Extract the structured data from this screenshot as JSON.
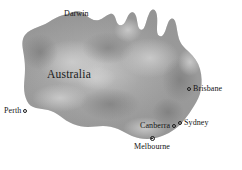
{
  "map": {
    "canvas": {
      "width": 242,
      "height": 170
    },
    "background_color": "#ffffff",
    "land_color": "#9a9a9a",
    "land_shadow_color": "#7d7d7d",
    "land_highlight_color": "#c2c2c2",
    "label_color": "#141414",
    "continent_label": "Australia",
    "region_name": "Australia",
    "cities": [
      {
        "name": "Darwin",
        "label": "Darwin",
        "marker": "none",
        "label_x": 64,
        "label_y": 9
      },
      {
        "name": "Perth",
        "label": "Perth",
        "marker": "open-circle",
        "marker_side": "right",
        "label_x": 4,
        "label_y": 106
      },
      {
        "name": "Brisbane",
        "label": "Brisbane",
        "marker": "open-circle",
        "marker_side": "left",
        "label_x": 192,
        "label_y": 84
      },
      {
        "name": "Sydney",
        "label": "Sydney",
        "marker": "open-circle",
        "marker_side": "left",
        "label_x": 185,
        "label_y": 118
      },
      {
        "name": "Canberra",
        "label": "Canberra",
        "marker": "open-circle",
        "marker_side": "right",
        "label_x": 140,
        "label_y": 121
      },
      {
        "name": "Melbourne",
        "label": "Melbourne",
        "marker": "ringed-dot",
        "marker_side": "above",
        "label_x": 134,
        "label_y": 143
      }
    ]
  }
}
